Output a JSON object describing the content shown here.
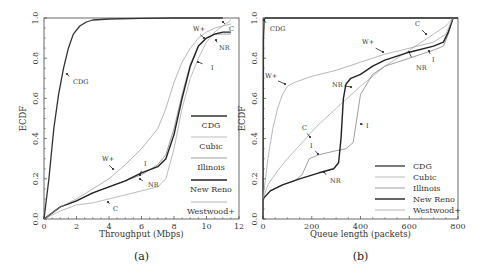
{
  "chart_data": [
    {
      "type": "line",
      "title": "",
      "caption": "(a)",
      "xlabel": "Throughput (Mbps)",
      "ylabel": "ECDF",
      "xlim": [
        0,
        12
      ],
      "ylim": [
        0,
        1.0
      ],
      "xticks": [
        "0",
        "2",
        "4",
        "6",
        "8",
        "10",
        "12"
      ],
      "yticks": [
        "0.0",
        "0.2",
        "0.4",
        "0.6",
        "0.8",
        "1.0"
      ],
      "legend": [
        "CDG",
        "Cubic",
        "Illinois",
        "New Reno",
        "Westwood+"
      ],
      "legend_position": "lower right",
      "annotations": [
        "CDG",
        "W+",
        "C",
        "NR",
        "I"
      ],
      "series": [
        {
          "name": "CDG",
          "x": [
            0,
            0.3,
            0.6,
            0.9,
            1.2,
            1.5,
            1.8,
            2.2,
            2.6,
            3.0,
            4.0,
            6.0,
            8.0,
            11.0
          ],
          "y": [
            0,
            0.2,
            0.45,
            0.62,
            0.75,
            0.85,
            0.92,
            0.96,
            0.98,
            0.99,
            0.995,
            0.998,
            1.0,
            1.0
          ]
        },
        {
          "name": "Cubic",
          "x": [
            0,
            1,
            2,
            3,
            4,
            5,
            6,
            7,
            7.5,
            8,
            8.5,
            9,
            9.5,
            10,
            10.5,
            11,
            11.5
          ],
          "y": [
            0,
            0.04,
            0.07,
            0.08,
            0.1,
            0.12,
            0.14,
            0.16,
            0.2,
            0.35,
            0.55,
            0.7,
            0.8,
            0.88,
            0.93,
            0.96,
            0.99
          ]
        },
        {
          "name": "Illinois",
          "x": [
            0,
            1,
            2,
            3,
            4,
            5,
            6,
            7,
            7.5,
            8,
            8.5,
            9,
            9.5,
            10,
            10.5,
            11,
            11.5
          ],
          "y": [
            0,
            0.06,
            0.09,
            0.13,
            0.16,
            0.19,
            0.22,
            0.27,
            0.32,
            0.45,
            0.62,
            0.77,
            0.86,
            0.9,
            0.92,
            0.92,
            0.92
          ]
        },
        {
          "name": "New Reno",
          "x": [
            0,
            1,
            2,
            3,
            4,
            5,
            6,
            7,
            7.5,
            8,
            8.5,
            9,
            9.5,
            10,
            10.5,
            11,
            11.5
          ],
          "y": [
            0,
            0.06,
            0.09,
            0.13,
            0.16,
            0.19,
            0.23,
            0.26,
            0.3,
            0.42,
            0.6,
            0.76,
            0.86,
            0.9,
            0.92,
            0.93,
            0.93
          ]
        },
        {
          "name": "Westwood+",
          "x": [
            0,
            1,
            2,
            3,
            4,
            5,
            6,
            7,
            7.5,
            8,
            8.5,
            9,
            9.5,
            10,
            10.5,
            11,
            11.5
          ],
          "y": [
            0,
            0.06,
            0.1,
            0.15,
            0.2,
            0.27,
            0.35,
            0.45,
            0.55,
            0.68,
            0.78,
            0.85,
            0.9,
            0.93,
            0.95,
            0.96,
            0.97
          ]
        }
      ]
    },
    {
      "type": "line",
      "title": "",
      "caption": "(b)",
      "xlabel": "Queue length (packets)",
      "ylabel": "ECDF",
      "xlim": [
        0,
        800
      ],
      "ylim": [
        0,
        1.0
      ],
      "xticks": [
        "0",
        "200",
        "400",
        "600",
        "800"
      ],
      "yticks": [
        "0.0",
        "0.2",
        "0.4",
        "0.6",
        "0.8",
        "1.0"
      ],
      "legend": [
        "CDG",
        "Cubic",
        "Illinois",
        "New Reno",
        "Westwood+"
      ],
      "legend_position": "lower right",
      "annotations": [
        "CDG",
        "W+",
        "C",
        "NR",
        "I"
      ],
      "series": [
        {
          "name": "CDG",
          "x": [
            0,
            2,
            5,
            10,
            800
          ],
          "y": [
            0,
            0.9,
            0.99,
            1.0,
            1.0
          ]
        },
        {
          "name": "Cubic",
          "x": [
            0,
            20,
            60,
            100,
            160,
            220,
            300,
            400,
            500,
            600,
            700,
            750,
            780
          ],
          "y": [
            0.1,
            0.17,
            0.24,
            0.3,
            0.38,
            0.46,
            0.55,
            0.66,
            0.76,
            0.84,
            0.92,
            0.96,
            1.0
          ]
        },
        {
          "name": "Illinois",
          "x": [
            0,
            30,
            80,
            130,
            160,
            190,
            230,
            300,
            340,
            370,
            400,
            450,
            500,
            600,
            700,
            740,
            760,
            780
          ],
          "y": [
            0.1,
            0.14,
            0.17,
            0.19,
            0.22,
            0.3,
            0.32,
            0.34,
            0.35,
            0.38,
            0.62,
            0.72,
            0.76,
            0.8,
            0.84,
            0.86,
            0.92,
            1.0
          ]
        },
        {
          "name": "New Reno",
          "x": [
            0,
            30,
            80,
            150,
            230,
            290,
            310,
            320,
            330,
            340,
            360,
            400,
            450,
            500,
            600,
            700,
            740,
            760,
            780
          ],
          "y": [
            0.1,
            0.14,
            0.17,
            0.2,
            0.23,
            0.25,
            0.28,
            0.4,
            0.6,
            0.67,
            0.7,
            0.72,
            0.76,
            0.79,
            0.83,
            0.86,
            0.88,
            0.93,
            1.0
          ]
        },
        {
          "name": "Westwood+",
          "x": [
            0,
            20,
            40,
            60,
            80,
            100,
            130,
            200,
            300,
            400,
            450,
            500,
            600,
            700,
            750,
            780
          ],
          "y": [
            0.1,
            0.3,
            0.45,
            0.55,
            0.62,
            0.66,
            0.68,
            0.71,
            0.74,
            0.78,
            0.8,
            0.82,
            0.85,
            0.88,
            0.92,
            1.0
          ]
        }
      ]
    }
  ],
  "styles": {
    "CDG": {
      "color": "#333333",
      "width": 1.3,
      "dash": ""
    },
    "Cubic": {
      "color": "#bdbdbd",
      "width": 1.0,
      "dash": ""
    },
    "Illinois": {
      "color": "#888888",
      "width": 0.8,
      "dash": ""
    },
    "New Reno": {
      "color": "#222222",
      "width": 1.4,
      "dash": ""
    },
    "Westwood+": {
      "color": "#9a9a9a",
      "width": 0.7,
      "dash": ""
    }
  }
}
